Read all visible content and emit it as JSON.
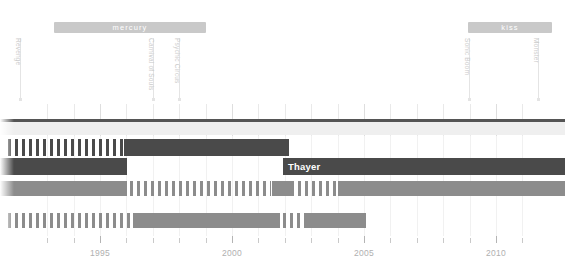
{
  "meta": {
    "chart_type": "timeline"
  },
  "colors": {
    "era_band": "#c9c9c9",
    "era_text": "#ffffff",
    "dark_row": "#4a4a4a",
    "mid_row": "#8c8c8c",
    "light_row": "#efefef",
    "topline": "#555555",
    "grid": "#e9e9e9",
    "axis_text": "#b0b0b0",
    "stem": "#e4e4e4",
    "event_text": "#cccccc",
    "row_label": "#ffffff"
  },
  "axis": {
    "ticks": [
      {
        "year": "1993",
        "label": "",
        "major": false
      },
      {
        "year": "1994",
        "label": "",
        "major": false
      },
      {
        "year": "1995",
        "label": "1995",
        "major": true
      },
      {
        "year": "1996",
        "label": "",
        "major": false
      },
      {
        "year": "1997",
        "label": "",
        "major": false
      },
      {
        "year": "1998",
        "label": "",
        "major": false
      },
      {
        "year": "1999",
        "label": "",
        "major": false
      },
      {
        "year": "2000",
        "label": "2000",
        "major": true
      },
      {
        "year": "2001",
        "label": "",
        "major": false
      },
      {
        "year": "2002",
        "label": "",
        "major": false
      },
      {
        "year": "2003",
        "label": "",
        "major": false
      },
      {
        "year": "2004",
        "label": "",
        "major": false
      },
      {
        "year": "2005",
        "label": "2005",
        "major": true
      },
      {
        "year": "2006",
        "label": "",
        "major": false
      },
      {
        "year": "2007",
        "label": "",
        "major": false
      },
      {
        "year": "2008",
        "label": "",
        "major": false
      },
      {
        "year": "2009",
        "label": "",
        "major": false
      },
      {
        "year": "2010",
        "label": "2010",
        "major": true
      },
      {
        "year": "2011",
        "label": "",
        "major": false
      }
    ],
    "labelled": [
      "1995",
      "2000",
      "2005",
      "2010"
    ],
    "range_start": 1993,
    "range_end": 2011.4
  },
  "eras": [
    {
      "id": "era-mercury",
      "label": "mercury",
      "x": 54,
      "width": 152
    },
    {
      "id": "era-kiss",
      "label": "kiss",
      "x": 468,
      "width": 84
    }
  ],
  "events": [
    {
      "id": "event-revenge",
      "label": "Revenge",
      "x": 20,
      "stem_top": 38,
      "stem_height": 62
    },
    {
      "id": "event-carnival-of-souls",
      "label": "Carnival of Souls",
      "x": 153,
      "stem_top": 38,
      "stem_height": 62
    },
    {
      "id": "event-psychic-circus",
      "label": "Psychic Circus",
      "x": 179,
      "stem_top": 38,
      "stem_height": 62
    },
    {
      "id": "event-sonic-boom",
      "label": "Sonic Boom",
      "x": 469,
      "stem_top": 38,
      "stem_height": 62
    },
    {
      "id": "event-monster",
      "label": "Monster",
      "x": 538,
      "stem_top": 38,
      "stem_height": 62
    }
  ],
  "rows": [
    {
      "id": "row-topline",
      "kind": "line",
      "top": 119,
      "height": 3,
      "color": "#555555",
      "segments": [
        {
          "x": 0,
          "width": 565,
          "style": "solid"
        }
      ]
    },
    {
      "id": "row-light-band",
      "kind": "band",
      "top": 122,
      "height": 13,
      "color": "#efefef",
      "segments": [
        {
          "x": 0,
          "width": 565,
          "style": "solid"
        }
      ]
    },
    {
      "id": "row-discography-dark",
      "kind": "bars",
      "top": 139,
      "height": 17,
      "color": "#4a4a4a",
      "segments": [
        {
          "x": 8,
          "width": 116,
          "style": "striped"
        },
        {
          "x": 124,
          "width": 165,
          "style": "solid"
        }
      ]
    },
    {
      "id": "row-touring-dark",
      "kind": "bars",
      "top": 158,
      "height": 17,
      "color": "#4a4a4a",
      "label": "Thayer",
      "label_x": 288,
      "segments": [
        {
          "x": 0,
          "width": 127,
          "style": "solid"
        },
        {
          "x": 283,
          "width": 282,
          "style": "solid"
        }
      ]
    },
    {
      "id": "row-members-mid",
      "kind": "bars",
      "top": 181,
      "height": 15,
      "color": "#8c8c8c",
      "segments": [
        {
          "x": 0,
          "width": 127,
          "style": "solid"
        },
        {
          "x": 130,
          "width": 141,
          "style": "striped"
        },
        {
          "x": 272,
          "width": 22,
          "style": "solid"
        },
        {
          "x": 298,
          "width": 40,
          "style": "striped"
        },
        {
          "x": 338,
          "width": 227,
          "style": "solid"
        }
      ]
    },
    {
      "id": "row-releases-mid",
      "kind": "bars",
      "top": 213,
      "height": 15,
      "color": "#8c8c8c",
      "segments": [
        {
          "x": 8,
          "width": 122,
          "style": "striped"
        },
        {
          "x": 133,
          "width": 147,
          "style": "solid"
        },
        {
          "x": 283,
          "width": 18,
          "style": "striped"
        },
        {
          "x": 304,
          "width": 62,
          "style": "solid"
        }
      ]
    }
  ]
}
